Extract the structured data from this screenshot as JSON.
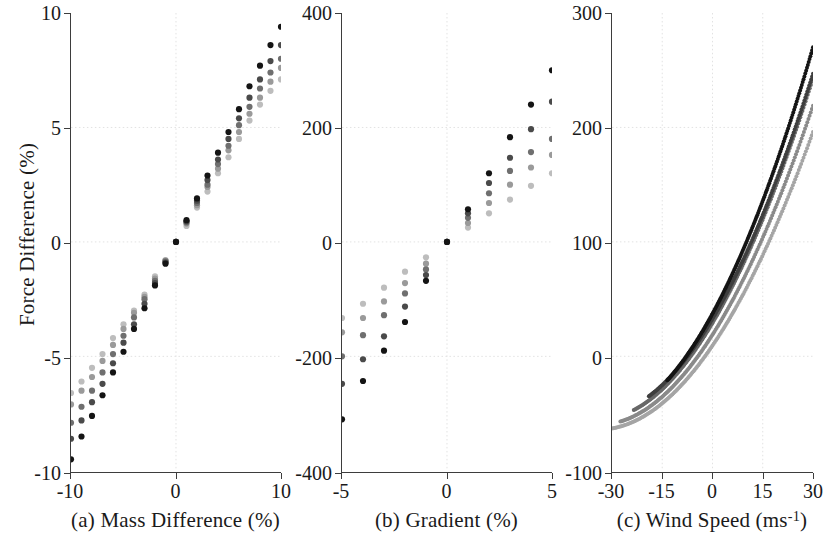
{
  "figure": {
    "ylabel": "Force Difference (%)",
    "background": "#ffffff",
    "axis_color": "#3d3d3d",
    "grid_color": "#e2e2e2"
  },
  "panels": [
    {
      "key": "a",
      "caption": "(a) Mass Difference (%)",
      "xticks": [
        "-10",
        "0",
        "10"
      ],
      "yticks": [
        "10",
        "5",
        "0",
        "-5",
        "-10"
      ]
    },
    {
      "key": "b",
      "caption": "(b) Gradient (%)",
      "xticks": [
        "-5",
        "0",
        "5"
      ],
      "yticks": [
        "400",
        "200",
        "0",
        "-200",
        "-400"
      ]
    },
    {
      "key": "c",
      "caption_pre": "(c) Wind Speed (ms",
      "caption_sup": "-1",
      "caption_post": ")",
      "xticks": [
        "-30",
        "-15",
        "0",
        "15",
        "30"
      ],
      "yticks": [
        "300",
        "200",
        "100",
        "0",
        "-100"
      ]
    }
  ],
  "chart_data": [
    {
      "type": "scatter",
      "panel": "a",
      "title": "(a) Mass Difference (%)",
      "xlabel": "Mass Difference (%)",
      "ylabel": "Force Difference (%)",
      "xlim": [
        -10,
        10
      ],
      "ylim": [
        -10,
        10
      ],
      "xticks": [
        -10,
        0,
        10
      ],
      "yticks": [
        -10,
        -5,
        0,
        5,
        10
      ],
      "grid": true,
      "series_colors": [
        "#bdbdbd",
        "#9a9a9a",
        "#6f6f6f",
        "#4a4a4a",
        "#141414"
      ],
      "x": [
        -10,
        -9,
        -8,
        -7,
        -6,
        -5,
        -4,
        -3,
        -2,
        -1,
        0,
        1,
        2,
        3,
        4,
        5,
        6,
        7,
        8,
        9,
        10
      ],
      "series": [
        {
          "name": "s1",
          "color": "#bdbdbd",
          "values": [
            -6.6,
            -6.1,
            -5.5,
            -4.9,
            -4.2,
            -3.6,
            -3.0,
            -2.3,
            -1.5,
            -0.8,
            0.0,
            0.7,
            1.5,
            2.2,
            3.0,
            3.7,
            4.5,
            5.3,
            6.0,
            6.6,
            7.1
          ]
        },
        {
          "name": "s2",
          "color": "#9a9a9a",
          "values": [
            -7.1,
            -6.5,
            -5.9,
            -5.2,
            -4.5,
            -3.8,
            -3.1,
            -2.4,
            -1.6,
            -0.8,
            0.0,
            0.8,
            1.6,
            2.4,
            3.2,
            4.0,
            4.8,
            5.6,
            6.3,
            7.0,
            7.6
          ]
        },
        {
          "name": "s3",
          "color": "#6f6f6f",
          "values": [
            -7.9,
            -7.2,
            -6.5,
            -5.7,
            -4.9,
            -4.1,
            -3.3,
            -2.5,
            -1.7,
            -0.85,
            0.0,
            0.85,
            1.7,
            2.5,
            3.4,
            4.2,
            5.1,
            5.9,
            6.7,
            7.4,
            8.0
          ]
        },
        {
          "name": "s4",
          "color": "#4a4a4a",
          "values": [
            -8.6,
            -7.8,
            -7.0,
            -6.2,
            -5.3,
            -4.4,
            -3.6,
            -2.7,
            -1.8,
            -0.9,
            0.0,
            0.9,
            1.8,
            2.7,
            3.6,
            4.5,
            5.4,
            6.3,
            7.1,
            7.9,
            8.6
          ]
        },
        {
          "name": "s5",
          "color": "#141414",
          "values": [
            -9.5,
            -8.5,
            -7.6,
            -6.7,
            -5.7,
            -4.8,
            -3.8,
            -2.9,
            -1.9,
            -0.95,
            0.0,
            0.95,
            1.9,
            2.9,
            3.9,
            4.8,
            5.8,
            6.8,
            7.7,
            8.6,
            9.4
          ]
        }
      ]
    },
    {
      "type": "scatter",
      "panel": "b",
      "title": "(b) Gradient (%)",
      "xlabel": "Gradient (%)",
      "ylabel": "Force Difference (%)",
      "xlim": [
        -5,
        5
      ],
      "ylim": [
        -400,
        400
      ],
      "xticks": [
        -5,
        0,
        5
      ],
      "yticks": [
        -400,
        -200,
        0,
        200,
        400
      ],
      "grid": true,
      "series_colors": [
        "#bdbdbd",
        "#9a9a9a",
        "#6f6f6f",
        "#4a4a4a",
        "#141414"
      ],
      "x": [
        -5,
        -4,
        -3,
        -2,
        -1,
        0,
        1,
        2,
        3,
        4,
        5
      ],
      "series": [
        {
          "name": "s1",
          "color": "#bdbdbd",
          "values": [
            -133,
            -108,
            -80,
            -52,
            -27,
            0,
            25,
            50,
            74,
            98,
            120
          ]
        },
        {
          "name": "s2",
          "color": "#9a9a9a",
          "values": [
            -158,
            -133,
            -104,
            -72,
            -38,
            0,
            33,
            68,
            100,
            130,
            152
          ]
        },
        {
          "name": "s3",
          "color": "#6f6f6f",
          "values": [
            -200,
            -163,
            -128,
            -90,
            -48,
            0,
            42,
            85,
            124,
            157,
            180
          ]
        },
        {
          "name": "s4",
          "color": "#4a4a4a",
          "values": [
            -248,
            -205,
            -165,
            -113,
            -58,
            0,
            50,
            103,
            147,
            197,
            245
          ]
        },
        {
          "name": "s5",
          "color": "#141414",
          "values": [
            -310,
            -243,
            -190,
            -140,
            -68,
            0,
            57,
            120,
            183,
            240,
            300
          ]
        }
      ]
    },
    {
      "type": "line",
      "panel": "c",
      "title": "(c) Wind Speed (ms-1)",
      "xlabel": "Wind Speed (ms-1)",
      "ylabel": "Force Difference (%)",
      "xlim": [
        -30,
        30
      ],
      "ylim": [
        -100,
        300
      ],
      "xticks": [
        -30,
        -15,
        0,
        15,
        30
      ],
      "yticks": [
        -100,
        0,
        100,
        200,
        300
      ],
      "grid": true,
      "note": "quadratic-like dense marker curves, each starting at a different negative wind speed",
      "series": [
        {
          "name": "s1",
          "color": "#a5a5a5",
          "x_start": -30,
          "x_end": 30,
          "y_start": -63,
          "y_end": 196
        },
        {
          "name": "s2",
          "color": "#8a8a8a",
          "x_start": -27.5,
          "x_end": 30,
          "y_start": -57,
          "y_end": 219
        },
        {
          "name": "s3",
          "color": "#686868",
          "x_start": -23.5,
          "x_end": 30,
          "y_start": -47,
          "y_end": 243
        },
        {
          "name": "s4",
          "color": "#3f3f3f",
          "x_start": -19,
          "x_end": 30,
          "y_start": -35,
          "y_end": 247
        },
        {
          "name": "s5",
          "color": "#141414",
          "x_start": -13.5,
          "x_end": 30,
          "y_start": -21,
          "y_end": 270
        }
      ]
    }
  ]
}
